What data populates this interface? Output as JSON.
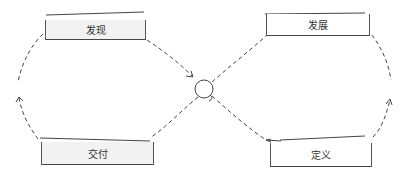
{
  "diagram": {
    "type": "double-loop-process",
    "style": "hand-drawn sketch, dashed connectors",
    "center_node": {
      "shape": "circle"
    },
    "nodes": [
      {
        "id": "discover",
        "label": "发现",
        "position": "top-left",
        "fill": "#f2f2f2"
      },
      {
        "id": "develop",
        "label": "发展",
        "position": "top-right",
        "fill": "#ffffff"
      },
      {
        "id": "define",
        "label": "定义",
        "position": "bottom-right",
        "fill": "#ffffff"
      },
      {
        "id": "deliver",
        "label": "交付",
        "position": "bottom-left",
        "fill": "#f2f2f2"
      }
    ],
    "edges": [
      {
        "from": "discover",
        "to": "center",
        "style": "dashed",
        "arrow": true
      },
      {
        "from": "center",
        "to": "develop",
        "style": "dashed",
        "arrow": false
      },
      {
        "from": "develop",
        "to": "right-arc",
        "style": "dashed",
        "arrow": false
      },
      {
        "from": "define",
        "to": "right-arc",
        "style": "dashed",
        "arrow": true
      },
      {
        "from": "center",
        "to": "define",
        "style": "dashed",
        "arrow": true
      },
      {
        "from": "center",
        "to": "deliver",
        "style": "dashed",
        "arrow": false
      },
      {
        "from": "deliver",
        "to": "left-arc",
        "style": "dashed",
        "arrow": true
      },
      {
        "from": "discover",
        "to": "left-arc",
        "style": "dashed",
        "arrow": false
      }
    ],
    "colors": {
      "stroke": "#444444",
      "text": "#333333",
      "gray_fill": "#f2f2f2",
      "background": "#ffffff"
    }
  }
}
